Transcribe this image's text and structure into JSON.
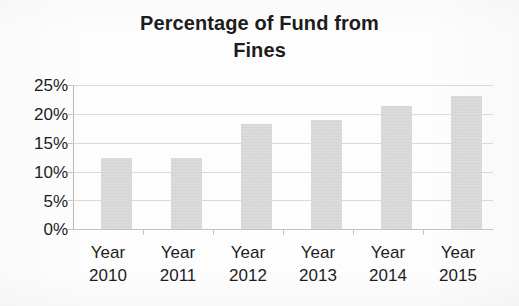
{
  "chart_data": {
    "type": "bar",
    "title": "Percentage of Fund from Fines",
    "title_lines": [
      "Percentage of Fund from",
      "Fines"
    ],
    "categories": [
      "Year 2010",
      "Year 2011",
      "Year 2012",
      "Year 2013",
      "Year 2014",
      "Year 2015"
    ],
    "category_lines": [
      {
        "line1": "Year",
        "line2": "2010"
      },
      {
        "line1": "Year",
        "line2": "2011"
      },
      {
        "line1": "Year",
        "line2": "2012"
      },
      {
        "line1": "Year",
        "line2": "2013"
      },
      {
        "line1": "Year",
        "line2": "2014"
      },
      {
        "line1": "Year",
        "line2": "2015"
      }
    ],
    "values": [
      12.3,
      12.3,
      18.2,
      18.9,
      21.3,
      23.1
    ],
    "value_labels": [
      "12.3%",
      "12.3%",
      "18.2%",
      "18.9%",
      "21.3%",
      "23.1%"
    ],
    "xlabel": "",
    "ylabel": "",
    "ylim": [
      0,
      25
    ],
    "ytick_values": [
      0,
      5,
      10,
      15,
      20,
      25
    ],
    "ytick_labels": [
      "0%",
      "5%",
      "10%",
      "15%",
      "20%",
      "25%"
    ],
    "grid": true,
    "legend": false,
    "bar_color": "#cfcfcf",
    "gridline_color": "#d9d9d9",
    "text_color": "#1d1d1d",
    "background_color": "#fdfdfd"
  }
}
